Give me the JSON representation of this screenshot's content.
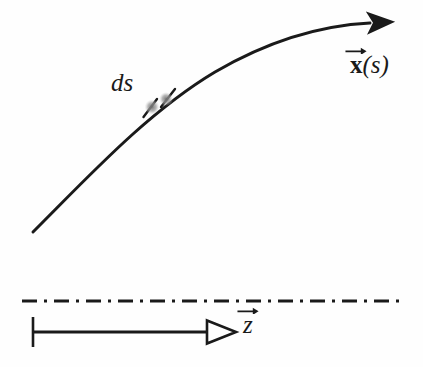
{
  "figure": {
    "background_color": "#fefefe",
    "ink_color": "#1a1a1a",
    "width": 423,
    "height": 367
  },
  "labels": {
    "arc_element": "ds",
    "curve_vector_symbol": "x",
    "curve_parameter": "(s)",
    "axis_symbol": "z"
  },
  "curve": {
    "name": "x(s)",
    "start_point": [
      33,
      232
    ],
    "end_point": [
      378,
      23
    ],
    "control_points": [
      [
        120,
        140
      ],
      [
        250,
        45
      ]
    ],
    "stroke_width": 3,
    "arrowhead": "filled-triangle"
  },
  "arc_element_marker": {
    "tick_1": [
      150,
      108
    ],
    "tick_2": [
      168,
      97
    ],
    "dot_center": [
      152,
      107
    ],
    "dot_color": "#8a8a8a"
  },
  "axis": {
    "centerline": {
      "style": "dash-dot",
      "y": 301,
      "x_start": 22,
      "x_end": 401,
      "stroke_width": 3
    },
    "z_arrow": {
      "y": 332,
      "x_start": 33,
      "x_end": 238,
      "stroke_width": 3,
      "arrowhead": "open-triangle",
      "origin_tick": {
        "x": 33,
        "y_top": 317,
        "y_bottom": 347
      }
    }
  }
}
